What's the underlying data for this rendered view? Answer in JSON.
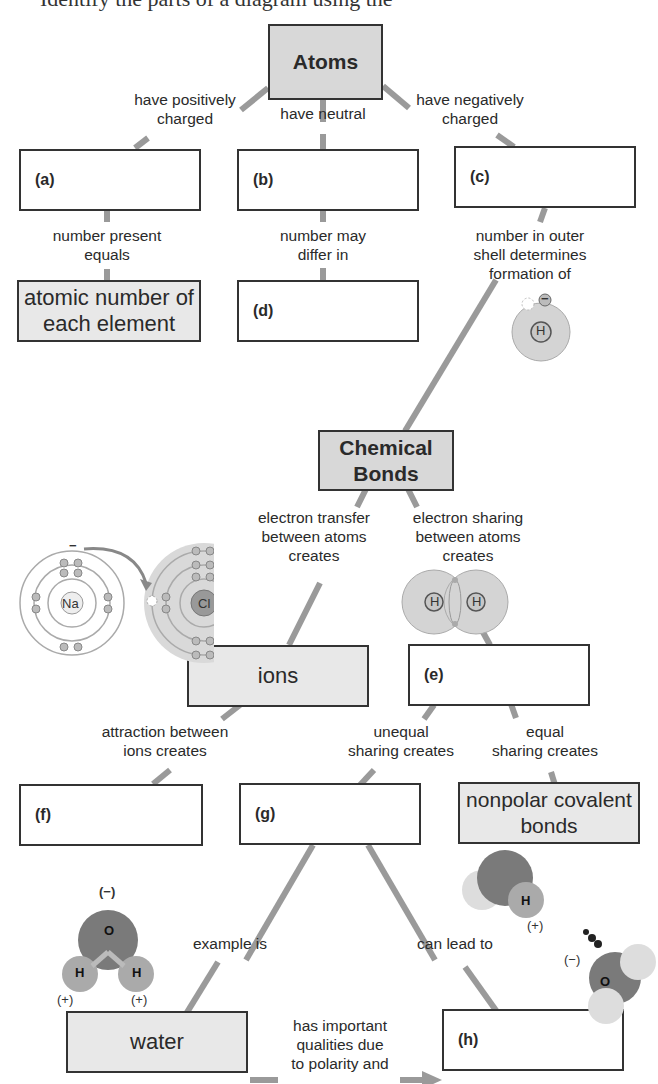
{
  "header": {
    "clipped_text": "Identify the parts of a diagram using the"
  },
  "nodes": {
    "atoms": "Atoms",
    "a": "(a)",
    "b": "(b)",
    "c": "(c)",
    "atomic_number": "atomic number of each element",
    "d": "(d)",
    "chemical_bonds": "Chemical Bonds",
    "ions": "ions",
    "e": "(e)",
    "f": "(f)",
    "g": "(g)",
    "nonpolar": "nonpolar covalent bonds",
    "water": "water",
    "h": "(h)"
  },
  "links": {
    "positively": "have positively\ncharged",
    "neutral": "have neutral",
    "negatively": "have negatively\ncharged",
    "number_present": "number present\nequals",
    "number_may": "number may\ndiffer in",
    "outer_shell": "number in outer\nshell determines\nformation of",
    "transfer": "electron transfer\nbetween atoms\ncreates",
    "sharing": "electron sharing\nbetween atoms\ncreates",
    "attraction": "attraction between\nions creates",
    "unequal": "unequal\nsharing creates",
    "equal": "equal\nsharing creates",
    "example": "example is",
    "lead": "can lead to",
    "qualities": "has important\nqualities due\nto polarity and"
  },
  "illustrations": {
    "h_atom": {
      "symbol": "H",
      "charge": "−"
    },
    "nacl": {
      "na": "Na",
      "cl": "Cl",
      "charge": "−"
    },
    "h2": {
      "left": "H",
      "right": "H"
    },
    "water_molecule": {
      "o": "O",
      "h1": "H",
      "h2": "H",
      "neg": "(−)",
      "pos1": "(+)",
      "pos2": "(+)"
    },
    "hbond": {
      "h": "H",
      "o": "O",
      "pos": "(+)",
      "neg": "(−)"
    }
  },
  "colors": {
    "connector": "#9a9a9a",
    "box_border": "#333333",
    "title_fill": "#d8d8d8",
    "filled": "#e8e8e8",
    "atom": "#d4d4d4",
    "molecule": "#8a8a8a"
  }
}
